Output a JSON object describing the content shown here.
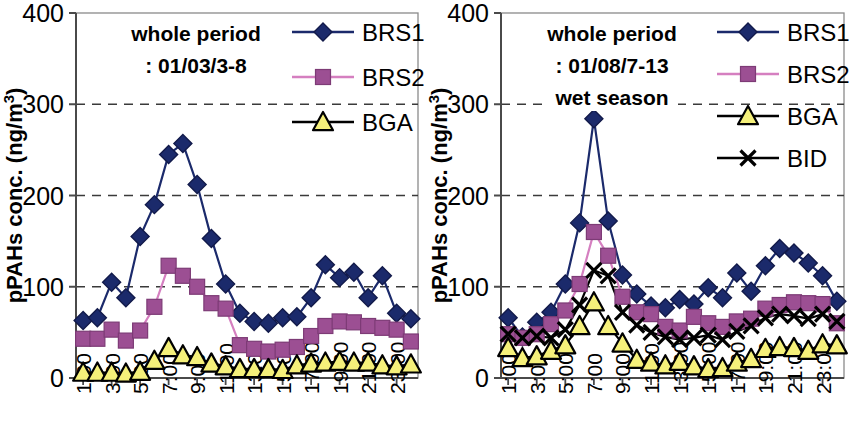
{
  "figure": {
    "panels": [
      {
        "id": "left",
        "annotation_line1": "whole period",
        "annotation_line2": ": 01/03/3-8",
        "annotation_line3": "",
        "ylabel_main": "pPAHs conc. (ng/m",
        "ylabel_sup": "3",
        "ylabel_close": ")",
        "legend": [
          {
            "label": "BRS1",
            "marker": "diamond",
            "color": "#1b2a6b",
            "line": "#1b2a6b"
          },
          {
            "label": "BRS2",
            "marker": "square",
            "color": "#9c4f93",
            "line": "#d57fc0"
          },
          {
            "label": "BGA",
            "marker": "triangle",
            "color": "#f5f07a",
            "line": "#000000"
          }
        ]
      },
      {
        "id": "right",
        "annotation_line1": "whole period",
        "annotation_line2": ": 01/08/7-13",
        "annotation_line3": "wet season",
        "ylabel_main": "pPAHs conc. (ng/m",
        "ylabel_sup": "3",
        "ylabel_close": ")",
        "legend": [
          {
            "label": "BRS1",
            "marker": "diamond",
            "color": "#1b2a6b",
            "line": "#1b2a6b"
          },
          {
            "label": "BRS2",
            "marker": "square",
            "color": "#9c4f93",
            "line": "#d57fc0"
          },
          {
            "label": "BGA",
            "marker": "triangle",
            "color": "#f5f07a",
            "line": "#000000"
          },
          {
            "label": "BID",
            "marker": "cross",
            "color": "#000000",
            "line": "#000000"
          }
        ]
      }
    ]
  },
  "chart_data": [
    {
      "type": "line",
      "panel": "left",
      "title": "whole period : 01/03/3-8",
      "xlabel": "",
      "ylabel": "pPAHs conc. (ng/m3)",
      "ylim": [
        0,
        400
      ],
      "yticks": [
        0,
        100,
        200,
        300,
        400
      ],
      "grid": "horizontal-dashed at 100,200,300",
      "legend_position": "top-right",
      "x": [
        "1:00",
        "2:00",
        "3:00",
        "4:00",
        "5:00",
        "6:00",
        "7:00",
        "8:00",
        "9:00",
        "10:00",
        "11:00",
        "12:00",
        "13:00",
        "14:00",
        "15:00",
        "16:00",
        "17:00",
        "18:00",
        "19:00",
        "20:00",
        "21:00",
        "22:00",
        "23:00",
        "24:00"
      ],
      "xtick_labels": [
        "1:00",
        "3:00",
        "5:00",
        "7:00",
        "9:00",
        "11:00",
        "13:00",
        "15:00",
        "17:00",
        "19:00",
        "21:00",
        "23:00"
      ],
      "series": [
        {
          "name": "BRS1",
          "marker": "diamond",
          "color": "#1b2a6b",
          "values": [
            63,
            66,
            105,
            88,
            155,
            190,
            245,
            257,
            212,
            153,
            103,
            71,
            62,
            60,
            66,
            67,
            88,
            124,
            110,
            116,
            88,
            112,
            71,
            65
          ]
        },
        {
          "name": "BRS2",
          "marker": "square",
          "color": "#9c4f93",
          "values": [
            43,
            43,
            53,
            41,
            52,
            78,
            123,
            112,
            100,
            82,
            76,
            36,
            32,
            29,
            31,
            34,
            46,
            57,
            62,
            61,
            57,
            55,
            53,
            40
          ]
        },
        {
          "name": "BGA",
          "marker": "triangle",
          "color": "#f5f07a",
          "values": [
            6,
            6,
            6,
            5,
            7,
            19,
            33,
            25,
            23,
            16,
            13,
            10,
            10,
            10,
            9,
            14,
            16,
            17,
            18,
            17,
            17,
            14,
            13,
            15
          ]
        }
      ]
    },
    {
      "type": "line",
      "panel": "right",
      "title": "whole period : 01/08/7-13  wet season",
      "xlabel": "",
      "ylabel": "pPAHs conc. (ng/m3)",
      "ylim": [
        0,
        400
      ],
      "yticks": [
        0,
        100,
        200,
        300,
        400
      ],
      "grid": "horizontal-dashed at 100,200,300",
      "legend_position": "top-right",
      "x": [
        "1:00",
        "2:00",
        "3:00",
        "4:00",
        "5:00",
        "6:00",
        "7:00",
        "8:00",
        "9:00",
        "10:00",
        "11:00",
        "12:00",
        "13:00",
        "14:00",
        "15:00",
        "16:00",
        "17:00",
        "18:00",
        "19:00",
        "20:00",
        "21:00",
        "22:00",
        "23:00",
        "24:00"
      ],
      "xtick_labels": [
        "1:00",
        "3:00",
        "5:00",
        "7:00",
        "9:00",
        "11:00",
        "13:00",
        "15:00",
        "17:00",
        "19:00",
        "21:00",
        "23:00"
      ],
      "series": [
        {
          "name": "BRS1",
          "marker": "diamond",
          "color": "#1b2a6b",
          "values": [
            66,
            45,
            61,
            72,
            103,
            170,
            284,
            172,
            113,
            92,
            79,
            77,
            86,
            81,
            99,
            88,
            115,
            95,
            123,
            142,
            137,
            126,
            112,
            84
          ]
        },
        {
          "name": "BRS2",
          "marker": "square",
          "color": "#9c4f93",
          "values": [
            48,
            44,
            48,
            59,
            74,
            103,
            160,
            134,
            89,
            72,
            70,
            56,
            52,
            67,
            60,
            56,
            62,
            65,
            76,
            80,
            83,
            82,
            81,
            60
          ]
        },
        {
          "name": "BGA",
          "marker": "triangle",
          "color": "#f5f07a",
          "values": [
            33,
            22,
            24,
            30,
            36,
            57,
            83,
            57,
            38,
            20,
            17,
            14,
            18,
            13,
            10,
            11,
            17,
            21,
            32,
            34,
            33,
            30,
            37,
            36
          ]
        },
        {
          "name": "BID",
          "marker": "cross",
          "color": "#000000",
          "values": [
            48,
            44,
            46,
            44,
            53,
            80,
            118,
            112,
            72,
            58,
            50,
            45,
            42,
            44,
            47,
            42,
            51,
            57,
            66,
            70,
            68,
            65,
            70,
            62
          ]
        }
      ]
    }
  ]
}
